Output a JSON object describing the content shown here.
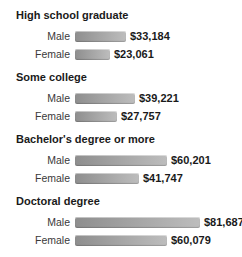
{
  "chart_data": {
    "type": "bar",
    "orientation": "horizontal",
    "title": "",
    "categories": [
      "High school graduate",
      "Some college",
      "Bachelor's degree or more",
      "Doctoral degree"
    ],
    "series": [
      {
        "name": "Male",
        "values": [
          33184,
          39221,
          60201,
          81687
        ],
        "value_labels": [
          "$33,184",
          "$39,221",
          "$60,201",
          "$81,687"
        ]
      },
      {
        "name": "Female",
        "values": [
          23061,
          27757,
          41747,
          60079
        ],
        "value_labels": [
          "$23,061",
          "$27,757",
          "$41,747",
          "$60,079"
        ]
      }
    ],
    "xlim": [
      0,
      85000
    ],
    "grid": false,
    "legend": "none",
    "bar_color_start": "#8e8e8e",
    "bar_color_end": "#bdbdbd"
  },
  "colors": {
    "background": "#ffffff",
    "heading_text": "#1a1a1a",
    "row_label_text": "#3a3a3a",
    "value_text": "#1a1a1a"
  }
}
